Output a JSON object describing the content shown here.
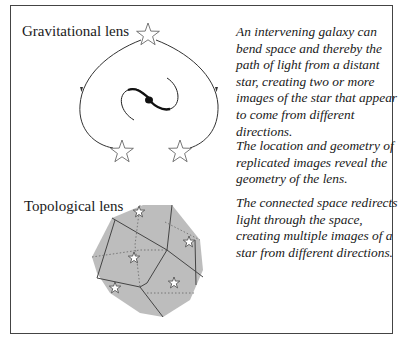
{
  "gravitational": {
    "title": "Gravitational lens",
    "paragraph1": "An intervening galaxy can bend space and thereby the path of light from a distant star, creating two or more images of the star that appear to come from different directions.",
    "paragraph2": "The location and geometry of replicated images reveal the geometry of the lens.",
    "icons": [
      "star-icon",
      "galaxy-spiral-icon",
      "light-path-arrow-icon"
    ]
  },
  "topological": {
    "title": "Topological lens",
    "paragraph": "The connected space redirects light through the space, creating multiple images of a star from different directions.",
    "icons": [
      "polyhedron-icon",
      "star-icon"
    ]
  },
  "colors": {
    "frame": "#444444",
    "polyhedron_fill": "#bdbdbd",
    "line": "#333333",
    "star_fill": "#ffffff"
  }
}
